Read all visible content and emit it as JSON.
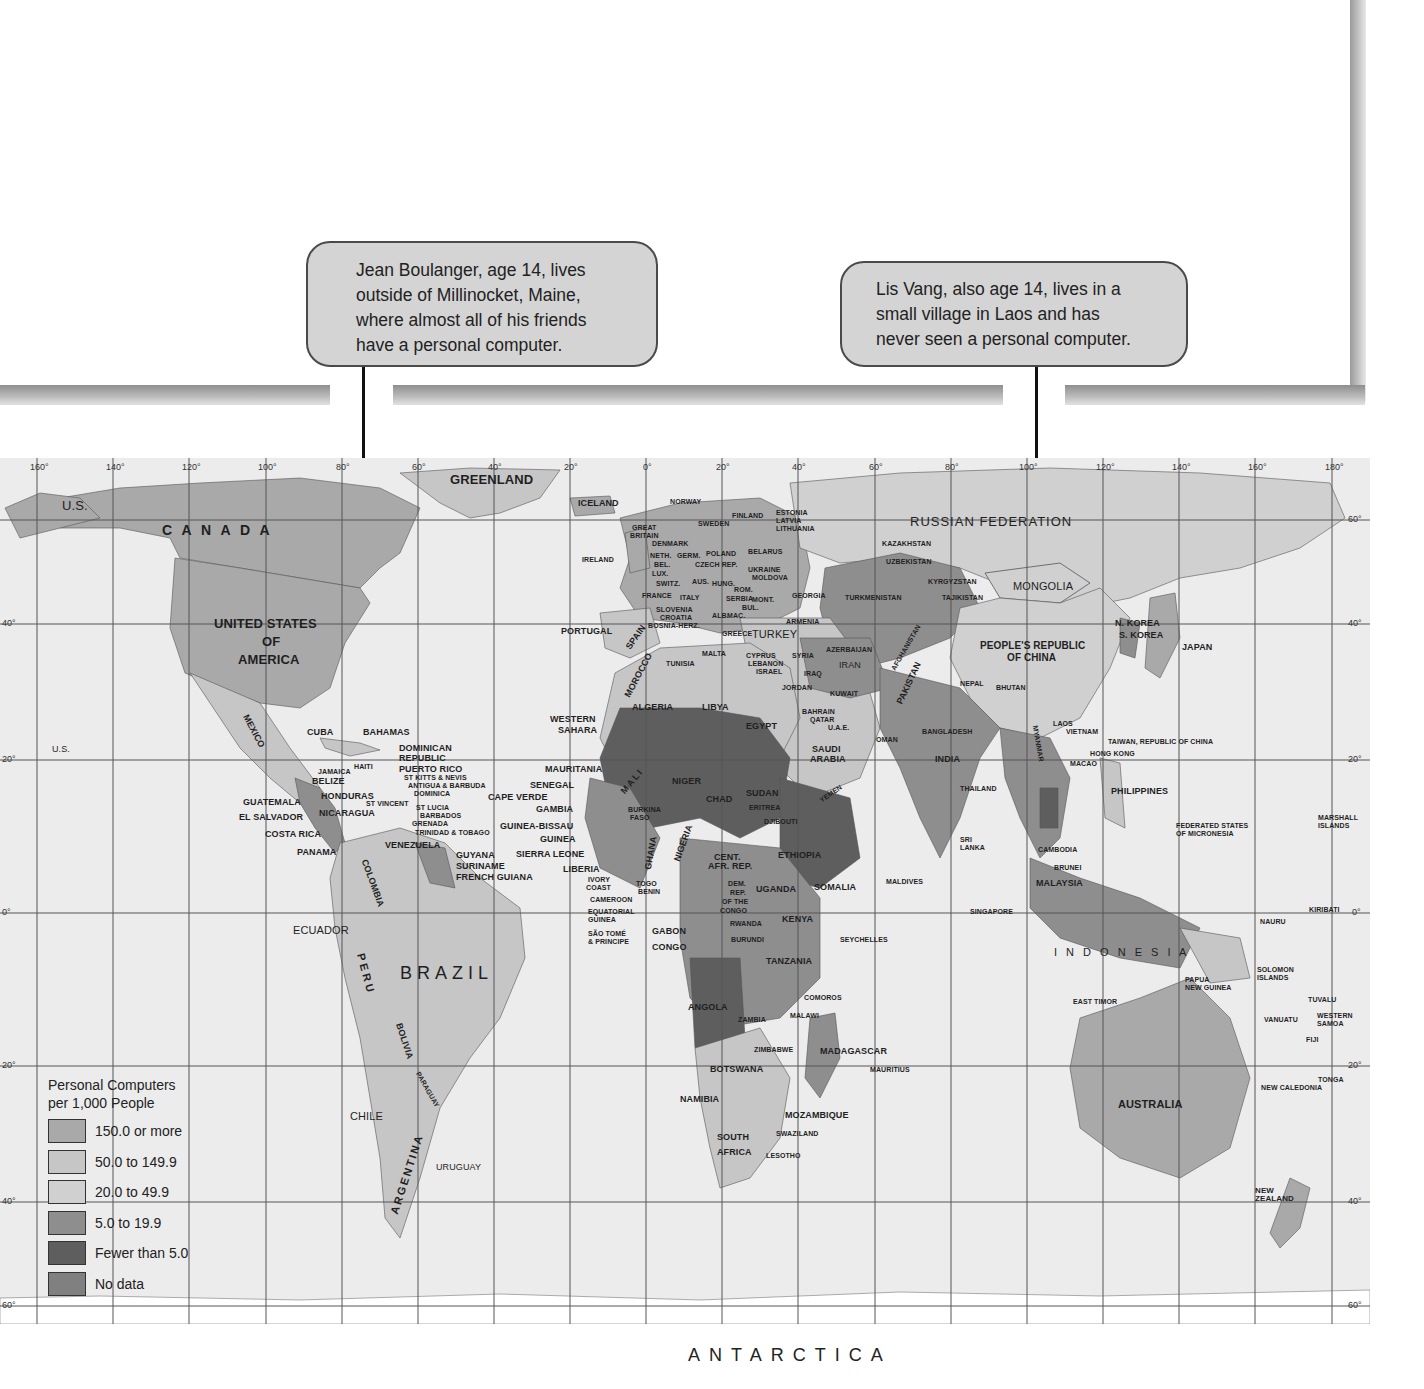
{
  "callouts": [
    {
      "id": "jean",
      "lines": [
        "Jean Boulanger, age 14, lives",
        "outside of Millinocket, Maine,",
        "where almost all of his friends",
        "have a personal computer."
      ],
      "points_to": "Maine, United States"
    },
    {
      "id": "lis",
      "lines": [
        "Lis Vang, also age 14, lives in a",
        "small village in Laos and has",
        "never seen a personal computer."
      ],
      "points_to": "Laos"
    }
  ],
  "legend": {
    "title_line1": "Personal Computers",
    "title_line2": "per 1,000 People",
    "items": [
      {
        "label": "150.0 or more",
        "color": "#a9a9a9"
      },
      {
        "label": "50.0 to 149.9",
        "color": "#c6c6c6"
      },
      {
        "label": "20.0 to 49.9",
        "color": "#d0d0d0"
      },
      {
        "label": "5.0 to 19.9",
        "color": "#8e8e8e"
      },
      {
        "label": "Fewer than 5.0",
        "color": "#5e5e5e"
      },
      {
        "label": "No data",
        "color": "#808080"
      }
    ]
  },
  "map": {
    "longitudes": [
      "160°",
      "140°",
      "120°",
      "100°",
      "80°",
      "60°",
      "40°",
      "20°",
      "0°",
      "20°",
      "40°",
      "60°",
      "80°",
      "100°",
      "120°",
      "140°",
      "160°",
      "180°"
    ],
    "latitudes_left": [
      "40°",
      "20°",
      "0°",
      "20°",
      "40°",
      "60°"
    ],
    "latitudes_right": [
      "60°",
      "40°",
      "20°",
      "0°",
      "20°",
      "40°",
      "60°"
    ],
    "antarctica": "ANTARCTICA",
    "labels": {
      "greenland": "GREENLAND",
      "iceland": "ICELAND",
      "us_alaska": "U.S.",
      "us_hawaii": "U.S.",
      "canada": "C A N A D A",
      "usa1": "UNITED STATES",
      "usa2": "OF",
      "usa3": "AMERICA",
      "mexico": "MEXICO",
      "cuba": "CUBA",
      "bahamas": "BAHAMAS",
      "dominican1": "DOMINICAN",
      "dominican2": "REPUBLIC",
      "haiti": "HAITI",
      "puerto_rico": "PUERTO RICO",
      "st_kitts": "ST KITTS & NEVIS",
      "antigua": "ANTIGUA & BARBUDA",
      "dominica": "DOMINICA",
      "jamaica": "JAMAICA",
      "belize": "BELIZE",
      "honduras": "HONDURAS",
      "guatemala": "GUATEMALA",
      "el_salvador": "EL SALVADOR",
      "nicaragua": "NICARAGUA",
      "costa_rica": "COSTA RICA",
      "panama": "PANAMA",
      "st_vincent": "ST VINCENT",
      "st_lucia": "ST LUCIA",
      "barbados": "BARBADOS",
      "grenada": "GRENADA",
      "trinidad": "TRINIDAD & TOBAGO",
      "venezuela": "VENEZUELA",
      "guyana": "GUYANA",
      "suriname": "SURINAME",
      "french_guiana": "FRENCH GUIANA",
      "colombia": "COLOMBIA",
      "ecuador": "ECUADOR",
      "peru": "PERU",
      "brazil": "BRAZIL",
      "bolivia": "BOLIVIA",
      "paraguay": "PARAGUAY",
      "chile": "CHILE",
      "argentina": "ARGENTINA",
      "uruguay": "URUGUAY",
      "norway": "NORWAY",
      "sweden": "SWEDEN",
      "finland": "FINLAND",
      "estonia": "ESTONIA",
      "latvia": "LATVIA",
      "lithuania": "LITHUANIA",
      "great_britain1": "GREAT",
      "great_britain2": "BRITAIN",
      "denmark": "DENMARK",
      "ireland": "IRELAND",
      "neth": "NETH.",
      "germ": "GERM.",
      "poland": "POLAND",
      "belarus": "BELARUS",
      "bel": "BEL.",
      "lux": "LUX.",
      "czech": "CZECH REP.",
      "slov": "SLOV.",
      "ukraine": "UKRAINE",
      "moldova": "MOLDOVA",
      "switz": "SWITZ.",
      "aus": "AUS.",
      "hung": "HUNG.",
      "france": "FRANCE",
      "italy": "ITALY",
      "rom": "ROM.",
      "serbia": "SERBIA",
      "mont": "MONT.",
      "georgia": "GEORGIA",
      "slovenia": "SLOVENIA",
      "croatia": "CROATIA",
      "bosnia": "BOSNIA-HERZ.",
      "alb": "ALB.",
      "mac": "MAC.",
      "bul": "BUL.",
      "portugal": "PORTUGAL",
      "spain": "SPAIN",
      "greece": "GREECE",
      "turkey": "TURKEY",
      "armenia": "ARMENIA",
      "azerbaijan": "AZERBAIJAN",
      "malta": "MALTA",
      "cyprus": "CYPRUS",
      "lebanon": "LEBANON",
      "israel": "ISRAEL",
      "syria": "SYRIA",
      "jordan": "JORDAN",
      "iraq": "IRAQ",
      "iran": "IRAN",
      "kuwait": "KUWAIT",
      "bahrain": "BAHRAIN",
      "qatar": "QATAR",
      "uae": "U.A.E.",
      "saudi1": "SAUDI",
      "saudi2": "ARABIA",
      "oman": "OMAN",
      "yemen": "YEMEN",
      "russia": "RUSSIAN   FEDERATION",
      "kazakhstan": "KAZAKHSTAN",
      "uzbekistan": "UZBEKISTAN",
      "kyrgyzstan": "KYRGYZSTAN",
      "turkmenistan": "TURKMENISTAN",
      "tajikistan": "TAJIKISTAN",
      "afghanistan": "AFGHANISTAN",
      "pakistan": "PAKISTAN",
      "mongolia": "MONGOLIA",
      "china1": "PEOPLE'S REPUBLIC",
      "china2": "OF CHINA",
      "n_korea": "N. KOREA",
      "s_korea": "S. KOREA",
      "japan": "JAPAN",
      "nepal": "NEPAL",
      "bhutan": "BHUTAN",
      "bangladesh": "BANGLADESH",
      "india": "INDIA",
      "myanmar": "MYANMAR",
      "laos": "LAOS",
      "vietnam": "VIETNAM",
      "taiwan": "TAIWAN, REPUBLIC OF CHINA",
      "hong_kong": "HONG KONG",
      "macao": "MACAO",
      "thailand": "THAILAND",
      "philippines": "PHILIPPINES",
      "sri_lanka1": "SRI",
      "sri_lanka2": "LANKA",
      "cambodia": "CAMBODIA",
      "brunei": "BRUNEI",
      "malaysia": "MALAYSIA",
      "maldives": "MALDIVES",
      "singapore": "SINGAPORE",
      "indonesia": "I N D O N E S I A",
      "east_timor": "EAST TIMOR",
      "png1": "PAPUA",
      "png2": "NEW GUINEA",
      "micronesia1": "FEDERATED STATES",
      "micronesia2": "OF MICRONESIA",
      "marshall1": "MARSHALL",
      "marshall2": "ISLANDS",
      "kiribati": "KIRIBATI",
      "nauru": "NAURU",
      "solomon1": "SOLOMON",
      "solomon2": "ISLANDS",
      "tuvalu": "TUVALU",
      "vanuatu": "VANUATU",
      "samoa1": "WESTERN",
      "samoa2": "SAMOA",
      "fiji": "FIJI",
      "tonga": "TONGA",
      "new_caledonia": "NEW CALEDONIA",
      "australia": "AUSTRALIA",
      "nz1": "NEW",
      "nz2": "ZEALAND",
      "western_sahara1": "WESTERN",
      "western_sahara2": "SAHARA",
      "morocco": "MOROCCO",
      "algeria": "ALGERIA",
      "tunisia": "TUNISIA",
      "libya": "LIBYA",
      "egypt": "EGYPT",
      "mauritania": "MAURITANIA",
      "mali": "MALI",
      "niger": "NIGER",
      "chad": "CHAD",
      "sudan": "SUDAN",
      "eritrea": "ERITREA",
      "djibouti": "DJIBOUTI",
      "ethiopia": "ETHIOPIA",
      "somalia": "SOMALIA",
      "senegal": "SENEGAL",
      "cape_verde": "CAPE VERDE",
      "gambia": "GAMBIA",
      "guinea_bissau": "GUINEA-BISSAU",
      "guinea": "GUINEA",
      "sierra_leone": "SIERRA LEONE",
      "liberia": "LIBERIA",
      "ivory1": "IVORY",
      "ivory2": "COAST",
      "burkina1": "BURKINA",
      "burkina2": "FASO",
      "ghana": "GHANA",
      "togo": "TOGO",
      "benin": "BENIN",
      "nigeria": "NIGERIA",
      "cameroon": "CAMEROON",
      "eq_guinea1": "EQUATORIAL",
      "eq_guinea2": "GUINEA",
      "sao_tome1": "SÃO TOMÉ",
      "sao_tome2": "& PRINCIPE",
      "car1": "CENT.",
      "car2": "AFR. REP.",
      "gabon": "GABON",
      "congo": "CONGO",
      "drc1": "DEM.",
      "drc2": "REP.",
      "drc3": "OF THE",
      "drc4": "CONGO",
      "uganda": "UGANDA",
      "kenya": "KENYA",
      "rwanda": "RWANDA",
      "burundi": "BURUNDI",
      "seychelles": "SEYCHELLES",
      "tanzania": "TANZANIA",
      "comoros": "COMOROS",
      "angola": "ANGOLA",
      "zambia": "ZAMBIA",
      "malawi": "MALAWI",
      "zimbabwe": "ZIMBABWE",
      "madagascar": "MADAGASCAR",
      "mauritius": "MAURITIUS",
      "botswana": "BOTSWANA",
      "namibia": "NAMIBIA",
      "mozambique": "MOZAMBIQUE",
      "swaziland": "SWAZILAND",
      "south_africa1": "SOUTH",
      "south_africa2": "AFRICA",
      "lesotho": "LESOTHO"
    }
  }
}
